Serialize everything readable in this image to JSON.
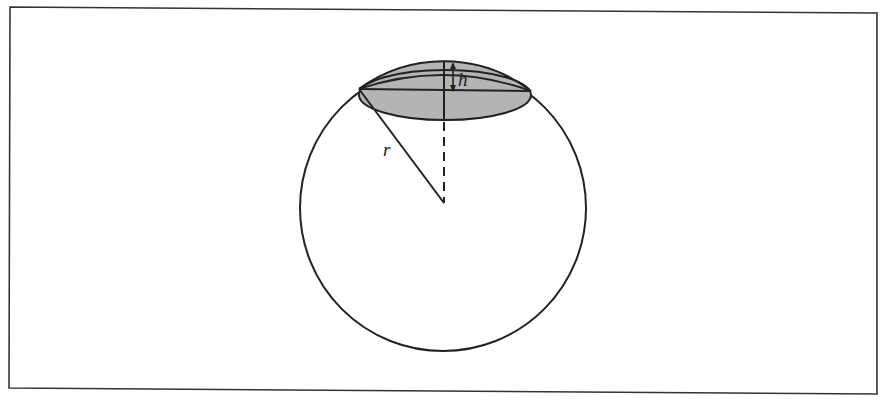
{
  "figure": {
    "labels": {
      "height": "h",
      "radius": "r"
    },
    "colors": {
      "stroke": "#222222",
      "cap_fill": "#b4b4b4",
      "frame": "#333333",
      "background": "#ffffff"
    }
  }
}
